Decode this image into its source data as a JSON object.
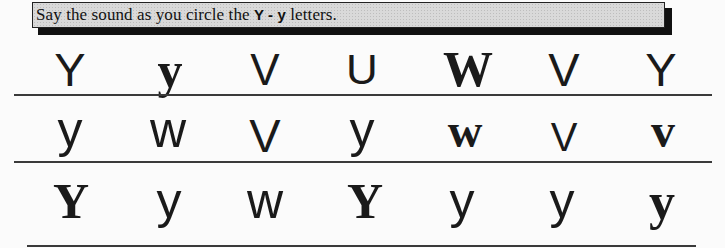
{
  "header": {
    "instruction_prefix": "Say the sound as you circle the ",
    "instruction_target": "Y - y",
    "instruction_suffix": " letters."
  },
  "rows": [
    {
      "letters": [
        {
          "char": "Y",
          "style": "sans"
        },
        {
          "char": "y",
          "style": "serif"
        },
        {
          "char": "V",
          "style": "sans"
        },
        {
          "char": "U",
          "style": "sans"
        },
        {
          "char": "W",
          "style": "serif"
        },
        {
          "char": "V",
          "style": "sans"
        },
        {
          "char": "Y",
          "style": "sans"
        }
      ]
    },
    {
      "letters": [
        {
          "char": "y",
          "style": "sans"
        },
        {
          "char": "w",
          "style": "sans"
        },
        {
          "char": "V",
          "style": "sans"
        },
        {
          "char": "y",
          "style": "sans"
        },
        {
          "char": "w",
          "style": "serif"
        },
        {
          "char": "V",
          "style": "sans"
        },
        {
          "char": "v",
          "style": "serif"
        }
      ]
    },
    {
      "letters": [
        {
          "char": "Y",
          "style": "serif"
        },
        {
          "char": "y",
          "style": "sans"
        },
        {
          "char": "w",
          "style": "sans"
        },
        {
          "char": "Y",
          "style": "serif"
        },
        {
          "char": "y",
          "style": "sans"
        },
        {
          "char": "y",
          "style": "sans"
        },
        {
          "char": "y",
          "style": "serif"
        }
      ]
    }
  ]
}
